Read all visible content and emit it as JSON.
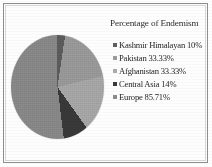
{
  "figure": {
    "border_color": "#8e8e8e",
    "background": "#fdfdfd"
  },
  "chart_data": {
    "type": "pie",
    "title": "Percentage of Endemism",
    "xlabel": "",
    "ylabel": "",
    "legend_position": "right",
    "grid": false,
    "categories": [
      "Kashmir Himalayan",
      "Pakistan",
      "Afghanistan",
      "Central Asia",
      "Europe"
    ],
    "values": [
      10,
      33.33,
      33.33,
      14,
      85.71
    ],
    "value_labels": [
      "10%",
      "33.33%",
      "33.33%",
      "14%",
      "85.71%"
    ],
    "slice_colors": [
      "#5e5e5e",
      "#9c9c9c",
      "#aaaaaa",
      "#3a3a3a",
      "#8b8b8b"
    ],
    "slice_fractions": [
      0.0556,
      0.1852,
      0.1852,
      0.0778,
      0.4762
    ],
    "legend_entries": [
      {
        "label": "Kashmir Himalayan 10%",
        "color": "#5e5e5e"
      },
      {
        "label": "Pakistan 33.33%",
        "color": "#9c9c9c"
      },
      {
        "label": "Afghanistan 33.33%",
        "color": "#aaaaaa"
      },
      {
        "label": "Central Asia 14%",
        "color": "#3a3a3a"
      },
      {
        "label": "Europe 85.71%",
        "color": "#8b8b8b"
      }
    ]
  }
}
